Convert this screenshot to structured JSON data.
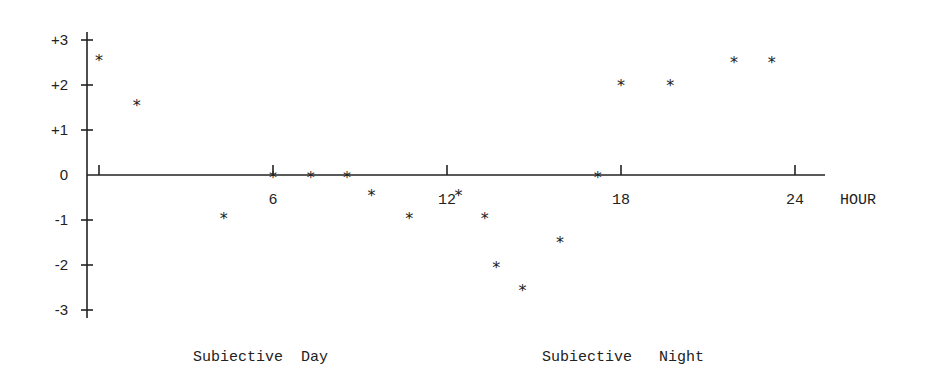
{
  "chart_data": {
    "type": "scatter",
    "title": "",
    "xlabel": "HOUR",
    "ylabel": "",
    "xlim": [
      0,
      24
    ],
    "ylim": [
      -3,
      3
    ],
    "x_ticks": [
      0,
      6,
      12,
      18,
      24
    ],
    "x_tick_labels": [
      "",
      "6",
      "12",
      "18",
      "24"
    ],
    "y_ticks": [
      3,
      2,
      1,
      0,
      -1,
      -2,
      -3
    ],
    "y_tick_labels": [
      "+3",
      "+2",
      "+1",
      "0",
      "-1",
      "-2",
      "-3"
    ],
    "grid": false,
    "marker": "*",
    "series": [
      {
        "name": "phase shift",
        "x": [
          0.0,
          1.3,
          4.3,
          6.0,
          7.3,
          8.55,
          9.4,
          10.7,
          12.4,
          13.3,
          13.7,
          14.6,
          15.9,
          17.2,
          18.0,
          19.7,
          21.9,
          23.2
        ],
        "y": [
          2.6,
          1.6,
          -0.9,
          0,
          0,
          0,
          -0.4,
          -0.9,
          -0.4,
          -0.9,
          -2.0,
          -2.5,
          -1.45,
          0,
          2.05,
          2.05,
          2.55,
          2.55
        ]
      }
    ],
    "annotations": [
      {
        "text": "Subiective  Day",
        "x_px": 193,
        "y_px": 361
      },
      {
        "text": "Subiective   Night",
        "x_px": 542,
        "y_px": 361
      }
    ]
  },
  "labels": {
    "x_axis_unit": "HOUR",
    "day_region": "Subiective  Day",
    "night_region": "Subiective   Night"
  }
}
